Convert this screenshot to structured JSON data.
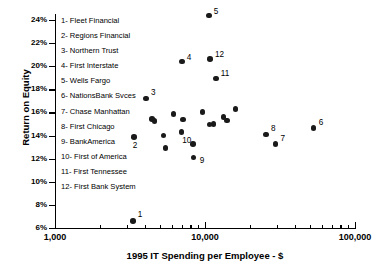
{
  "chart_data": {
    "type": "scatter",
    "title": "",
    "xlabel": "1995 IT Spending per Employee - $",
    "ylabel": "Return on Equity",
    "xscale": "log",
    "xlim": [
      1000,
      100000
    ],
    "ylim": [
      6,
      25
    ],
    "grid": false,
    "xticks": [
      {
        "value": 1000,
        "label": "1,000",
        "major": true
      },
      {
        "value": 2000,
        "label": "",
        "major": false
      },
      {
        "value": 3000,
        "label": "",
        "major": false
      },
      {
        "value": 4000,
        "label": "",
        "major": false
      },
      {
        "value": 5000,
        "label": "",
        "major": false
      },
      {
        "value": 6000,
        "label": "",
        "major": false
      },
      {
        "value": 7000,
        "label": "",
        "major": false
      },
      {
        "value": 8000,
        "label": "",
        "major": false
      },
      {
        "value": 9000,
        "label": "",
        "major": false
      },
      {
        "value": 10000,
        "label": "10,000",
        "major": true
      },
      {
        "value": 20000,
        "label": "",
        "major": false
      },
      {
        "value": 30000,
        "label": "",
        "major": false
      },
      {
        "value": 40000,
        "label": "",
        "major": false
      },
      {
        "value": 50000,
        "label": "",
        "major": false
      },
      {
        "value": 60000,
        "label": "",
        "major": false
      },
      {
        "value": 70000,
        "label": "",
        "major": false
      },
      {
        "value": 80000,
        "label": "",
        "major": false
      },
      {
        "value": 90000,
        "label": "",
        "major": false
      },
      {
        "value": 100000,
        "label": "100,000",
        "major": true
      }
    ],
    "yticks": [
      {
        "value": 24,
        "label": "24%"
      },
      {
        "value": 22,
        "label": "22%"
      },
      {
        "value": 20,
        "label": "20%"
      },
      {
        "value": 18,
        "label": "18%"
      },
      {
        "value": 16,
        "label": "16%"
      },
      {
        "value": 14,
        "label": "14%"
      },
      {
        "value": 12,
        "label": "12%"
      },
      {
        "value": 10,
        "label": "10%"
      },
      {
        "value": 8,
        "label": "8%"
      },
      {
        "value": 6,
        "label": "6%"
      }
    ],
    "legend_position": "upper-left-inside",
    "legend": [
      {
        "key": "1",
        "label": "1- Fleet Financial"
      },
      {
        "key": "2",
        "label": "2- Regions Financial"
      },
      {
        "key": "3",
        "label": "3- Northern Trust"
      },
      {
        "key": "4",
        "label": "4- First Interstate"
      },
      {
        "key": "5",
        "label": "5- Wells Fargo"
      },
      {
        "key": "6",
        "label": "6- NationsBank Svces"
      },
      {
        "key": "7",
        "label": "7- Chase Manhattan"
      },
      {
        "key": "8",
        "label": "8- First Chicago"
      },
      {
        "key": "9",
        "label": "9- BankAmerica"
      },
      {
        "key": "10",
        "label": "10- First of America"
      },
      {
        "key": "11",
        "label": "11- First Tennessee"
      },
      {
        "key": "12",
        "label": "12- First Bank System"
      }
    ],
    "points": [
      {
        "label": "1",
        "name": "Fleet Financial",
        "x": 3300,
        "y": 6.6,
        "lx": 5,
        "ly": -11
      },
      {
        "label": "2",
        "name": "Regions Financial",
        "x": 3350,
        "y": 13.9,
        "lx": -1,
        "ly": 4
      },
      {
        "label": "3",
        "name": "Northern Trust",
        "x": 4050,
        "y": 17.2,
        "lx": 5,
        "ly": -11
      },
      {
        "label": "4",
        "name": "First Interstate",
        "x": 7000,
        "y": 20.4,
        "lx": 5,
        "ly": -9
      },
      {
        "label": "5",
        "name": "Wells Fargo",
        "x": 10600,
        "y": 24.4,
        "lx": 5,
        "ly": -8
      },
      {
        "label": "6",
        "name": "NationsBank Svces",
        "x": 53000,
        "y": 14.65,
        "lx": 5,
        "ly": -10
      },
      {
        "label": "7",
        "name": "Chase Manhattan",
        "x": 29500,
        "y": 13.25,
        "lx": 5,
        "ly": -10
      },
      {
        "label": "8",
        "name": "First Chicago",
        "x": 25500,
        "y": 14.1,
        "lx": 5,
        "ly": -10
      },
      {
        "label": "9",
        "name": "BankAmerica",
        "x": 8400,
        "y": 12.1,
        "lx": 6,
        "ly": -2
      },
      {
        "label": "10",
        "name": "First of America",
        "x": 6950,
        "y": 14.3,
        "lx": 1,
        "ly": 4
      },
      {
        "label": "11",
        "name": "First Tennessee",
        "x": 11800,
        "y": 18.95,
        "lx": 5,
        "ly": -9
      },
      {
        "label": "12",
        "name": "First Bank System",
        "x": 10800,
        "y": 20.6,
        "lx": 5,
        "ly": -9
      },
      {
        "label": "",
        "name": "",
        "x": 4450,
        "y": 15.45
      },
      {
        "label": "",
        "name": "",
        "x": 4600,
        "y": 15.25
      },
      {
        "label": "",
        "name": "",
        "x": 5300,
        "y": 14.0
      },
      {
        "label": "",
        "name": "",
        "x": 5450,
        "y": 12.9
      },
      {
        "label": "",
        "name": "",
        "x": 6150,
        "y": 15.85
      },
      {
        "label": "",
        "name": "",
        "x": 7150,
        "y": 15.4
      },
      {
        "label": "",
        "name": "",
        "x": 8300,
        "y": 13.25
      },
      {
        "label": "",
        "name": "",
        "x": 9600,
        "y": 16.05
      },
      {
        "label": "",
        "name": "",
        "x": 10700,
        "y": 14.95
      },
      {
        "label": "",
        "name": "",
        "x": 11400,
        "y": 15.0
      },
      {
        "label": "",
        "name": "",
        "x": 13300,
        "y": 15.6
      },
      {
        "label": "",
        "name": "",
        "x": 14000,
        "y": 15.3
      },
      {
        "label": "",
        "name": "",
        "x": 16000,
        "y": 16.3
      }
    ]
  }
}
